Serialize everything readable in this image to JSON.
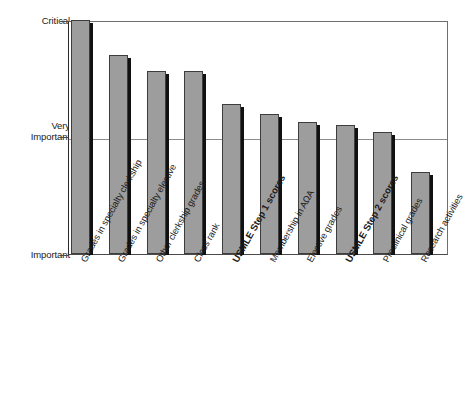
{
  "chart_data": {
    "type": "bar",
    "title": "",
    "subtitle": "",
    "xlabel": "",
    "ylabel": "",
    "grid": true,
    "legend": "none",
    "orientation": "vertical",
    "ylim": [
      0,
      2
    ],
    "ytick_values": [
      2,
      1,
      0
    ],
    "ytick_labels": [
      "Critical",
      "Very\nImportant",
      "Important"
    ],
    "categories": [
      "Grades in specialty clerkship",
      "Grades in specialty elective",
      "Other clerkship grades",
      "Class rank",
      "USMLE Step 1 scores",
      "Membership in AΩA",
      "Elective grades",
      "USMLE Step 2 scores",
      "Preclinical grades",
      "Research activities"
    ],
    "category_emphasis": [
      false,
      false,
      false,
      false,
      true,
      false,
      false,
      true,
      false,
      false
    ],
    "values": [
      2.0,
      1.7,
      1.56,
      1.56,
      1.28,
      1.2,
      1.13,
      1.1,
      1.04,
      0.7
    ],
    "bar_color": "#9d9d9d",
    "bar_edge_color": "#3d3d3d",
    "bar_shadow_color": "#111111",
    "axis_color": "#2b2b2b",
    "gridline_color": "#8d8d8d",
    "background_color": "#ffffff"
  }
}
